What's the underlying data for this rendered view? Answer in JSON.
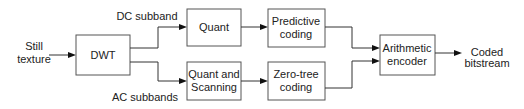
{
  "diagram": {
    "type": "block-diagram",
    "input": {
      "line1": "Still",
      "line2": "texture"
    },
    "output": {
      "line1": "Coded",
      "line2": "bitstream"
    },
    "nodes": {
      "dwt": {
        "label": "DWT"
      },
      "quant": {
        "label": "Quant"
      },
      "predictive": {
        "line1": "Predictive",
        "line2": "coding"
      },
      "quant_scan": {
        "line1": "Quant and",
        "line2": "Scanning"
      },
      "zerotree": {
        "line1": "Zero-tree",
        "line2": "coding"
      },
      "arith": {
        "line1": "Arithmetic",
        "line2": "encoder"
      }
    },
    "edge_labels": {
      "dc": "DC subband",
      "ac": "AC subbands"
    },
    "edges": [
      [
        "input",
        "dwt"
      ],
      [
        "dwt",
        "quant"
      ],
      [
        "dwt",
        "quant_scan"
      ],
      [
        "quant",
        "predictive"
      ],
      [
        "quant_scan",
        "zerotree"
      ],
      [
        "predictive",
        "arith"
      ],
      [
        "zerotree",
        "arith"
      ],
      [
        "arith",
        "output"
      ]
    ]
  }
}
